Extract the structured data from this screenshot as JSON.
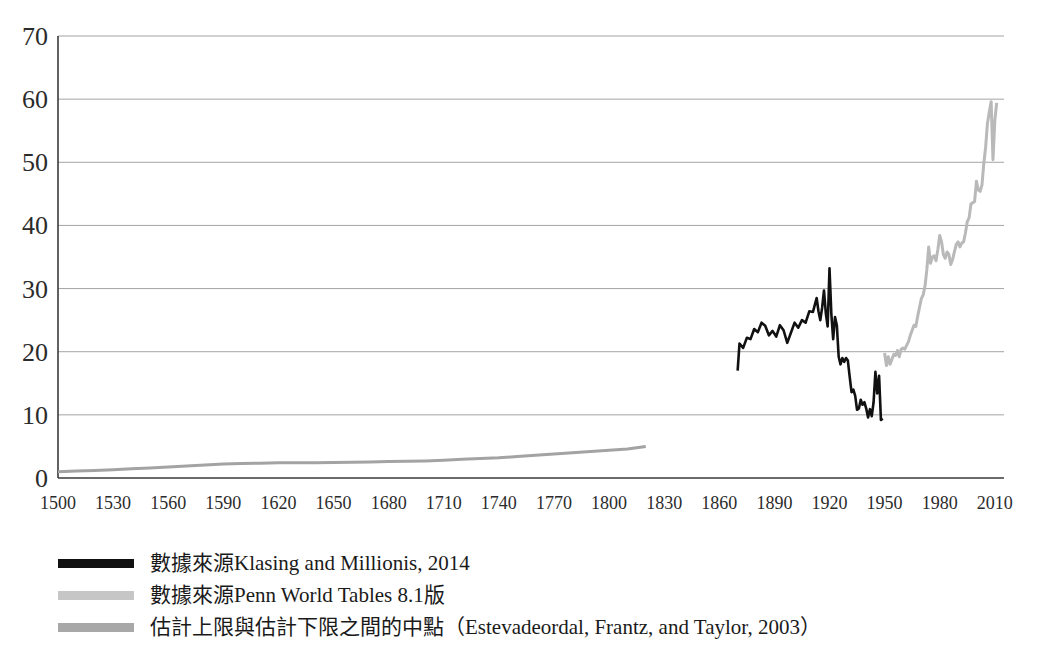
{
  "chart_data": {
    "type": "line",
    "title": "",
    "subtitle": "",
    "xlabel": "",
    "ylabel": "",
    "xlim": [
      1500,
      2015
    ],
    "ylim": [
      0,
      70
    ],
    "xticks": [
      1500,
      1530,
      1560,
      1590,
      1620,
      1650,
      1680,
      1710,
      1740,
      1770,
      1800,
      1830,
      1860,
      1890,
      1920,
      1950,
      1980,
      2010
    ],
    "yticks": [
      0,
      10,
      20,
      30,
      40,
      50,
      60,
      70
    ],
    "grid": "horizontal",
    "legend_position": "below",
    "series": [
      {
        "name": "數據來源Klasing and Millionis, 2014",
        "color": "#111111",
        "linewidth": 2.6,
        "x": [
          1870,
          1871,
          1873,
          1875,
          1877,
          1879,
          1881,
          1883,
          1885,
          1887,
          1889,
          1891,
          1893,
          1895,
          1897,
          1899,
          1901,
          1903,
          1905,
          1907,
          1909,
          1911,
          1913,
          1914,
          1915,
          1916,
          1917,
          1918,
          1919,
          1920,
          1921,
          1922,
          1923,
          1924,
          1925,
          1926,
          1927,
          1928,
          1929,
          1930,
          1931,
          1932,
          1933,
          1934,
          1935,
          1936,
          1937,
          1938,
          1939,
          1940,
          1941,
          1942,
          1943,
          1944,
          1945,
          1946,
          1947,
          1948,
          1949
        ],
        "y": [
          17.0,
          21.3,
          20.6,
          22.2,
          22.0,
          23.6,
          23.1,
          24.6,
          24.1,
          22.6,
          23.3,
          22.4,
          24.2,
          23.4,
          21.4,
          23.0,
          24.6,
          23.8,
          25.0,
          24.6,
          26.4,
          26.3,
          28.5,
          26.4,
          25.0,
          27.0,
          29.7,
          26.1,
          24.0,
          33.2,
          26.0,
          22.0,
          25.5,
          24.2,
          19.2,
          18.0,
          19.0,
          18.4,
          19.0,
          18.6,
          16.0,
          13.6,
          14.0,
          13.0,
          10.8,
          11.0,
          12.4,
          11.6,
          12.0,
          11.0,
          9.6,
          10.9,
          9.8,
          12.0,
          16.8,
          13.4,
          16.2,
          9.2,
          9.4
        ]
      },
      {
        "name": "數據來源Penn World Tables 8.1版",
        "color": "#b9b9b9",
        "linewidth": 3.0,
        "x": [
          1950,
          1951,
          1952,
          1953,
          1954,
          1955,
          1956,
          1957,
          1958,
          1959,
          1960,
          1961,
          1962,
          1963,
          1964,
          1965,
          1966,
          1967,
          1968,
          1969,
          1970,
          1971,
          1972,
          1973,
          1974,
          1975,
          1976,
          1977,
          1978,
          1979,
          1980,
          1981,
          1982,
          1983,
          1984,
          1985,
          1986,
          1987,
          1988,
          1989,
          1990,
          1991,
          1992,
          1993,
          1994,
          1995,
          1996,
          1997,
          1998,
          1999,
          2000,
          2001,
          2002,
          2003,
          2004,
          2005,
          2006,
          2007,
          2008,
          2009,
          2010,
          2011
        ],
        "y": [
          19.8,
          17.8,
          19.2,
          18.0,
          18.8,
          19.6,
          19.4,
          20.2,
          19.2,
          20.4,
          20.6,
          20.4,
          21.0,
          21.6,
          22.6,
          23.4,
          24.2,
          24.0,
          25.6,
          27.0,
          28.4,
          29.0,
          30.4,
          33.0,
          36.6,
          34.0,
          35.0,
          35.2,
          34.4,
          36.2,
          38.4,
          37.4,
          35.4,
          34.8,
          35.8,
          35.4,
          33.8,
          34.6,
          35.8,
          37.0,
          37.4,
          36.6,
          37.2,
          37.4,
          38.8,
          40.6,
          41.2,
          43.4,
          43.6,
          43.8,
          47.0,
          45.6,
          45.4,
          46.4,
          49.8,
          52.4,
          56.2,
          58.0,
          59.6,
          50.4,
          56.6,
          59.4
        ]
      },
      {
        "name": "估計上限與估計下限之間的中點（Estevadeordal, Frantz, and Taylor, 2003）",
        "color": "#a3a3a3",
        "linewidth": 3.0,
        "x": [
          1500,
          1510,
          1520,
          1530,
          1540,
          1550,
          1560,
          1570,
          1580,
          1590,
          1600,
          1610,
          1620,
          1630,
          1640,
          1650,
          1660,
          1670,
          1680,
          1690,
          1700,
          1710,
          1720,
          1730,
          1740,
          1750,
          1760,
          1770,
          1780,
          1790,
          1800,
          1810,
          1815,
          1820
        ],
        "y": [
          1.0,
          1.1,
          1.2,
          1.3,
          1.45,
          1.6,
          1.75,
          1.9,
          2.05,
          2.2,
          2.3,
          2.35,
          2.4,
          2.4,
          2.4,
          2.45,
          2.5,
          2.55,
          2.6,
          2.65,
          2.7,
          2.8,
          2.95,
          3.1,
          3.2,
          3.4,
          3.6,
          3.8,
          4.0,
          4.2,
          4.4,
          4.6,
          4.8,
          5.0
        ]
      }
    ],
    "legend": [
      {
        "label": "數據來源Klasing and Millionis, 2014",
        "color": "#111111"
      },
      {
        "label": "數據來源Penn World Tables 8.1版",
        "color": "#c6c6c6"
      },
      {
        "label": "估計上限與估計下限之間的中點（Estevadeordal, Frantz, and Taylor, 2003）",
        "color": "#a8a8a8"
      }
    ]
  }
}
